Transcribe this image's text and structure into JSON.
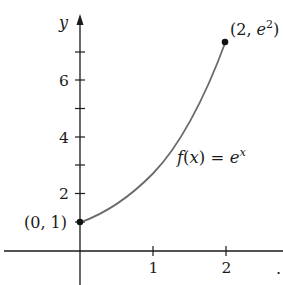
{
  "chart_data": {
    "type": "line",
    "title": "",
    "function_label": "f(x) = e^x",
    "xlabel": "x",
    "ylabel": "y",
    "x_ticks": [
      1,
      2
    ],
    "x_tick_labels": [
      "1",
      "2"
    ],
    "y_ticks": [
      1,
      2,
      3,
      4,
      5,
      6,
      7
    ],
    "y_tick_labels": [
      "2",
      "4",
      "6"
    ],
    "xlim": [
      -1.1,
      2.8
    ],
    "ylim": [
      -1.2,
      8.8
    ],
    "grid": false,
    "series": [
      {
        "name": "f(x) = e^x",
        "x": [
          0,
          0.25,
          0.5,
          0.75,
          1.0,
          1.25,
          1.5,
          1.75,
          2.0
        ],
        "y": [
          1.0,
          1.284,
          1.649,
          2.117,
          2.718,
          3.49,
          4.482,
          5.755,
          7.389
        ]
      }
    ],
    "annotations": [
      {
        "point": [
          0,
          1
        ],
        "label": "(0, 1)"
      },
      {
        "point": [
          2,
          7.389
        ],
        "label": "(2, e²)"
      }
    ]
  },
  "labels": {
    "y_axis": "y",
    "x_axis": ".",
    "tick_x1": "1",
    "tick_x2": "2",
    "tick_y2": "2",
    "tick_y4": "4",
    "tick_y6": "6",
    "point_start": "(0, 1)",
    "point_end_prefix": "(2, ",
    "point_end_base": "e",
    "point_end_exp": "2",
    "point_end_suffix": ")",
    "func_f": "f",
    "func_paren": "(x) = ",
    "func_base": "e",
    "func_exp": "x"
  },
  "colors": {
    "axis": "#1a1a1a",
    "curve": "#6b6b6b",
    "points": "#111111"
  }
}
